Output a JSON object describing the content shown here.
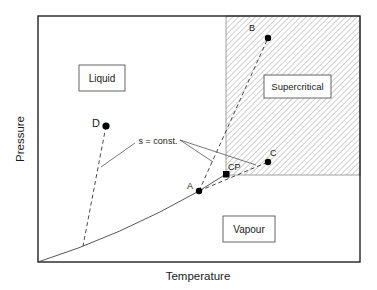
{
  "diagram": {
    "type": "phase-diagram",
    "axes": {
      "xlabel": "Temperature",
      "ylabel": "Pressure"
    },
    "regions": [
      {
        "id": "liquid",
        "label": "Liquid"
      },
      {
        "id": "supercritical",
        "label": "Supercritical"
      },
      {
        "id": "vapour",
        "label": "Vapour"
      }
    ],
    "points": {
      "A": "A",
      "B": "B",
      "C": "C",
      "D": "D",
      "CP": "CP"
    },
    "annotations": {
      "isentrope": "s = const."
    },
    "colors": {
      "line": "#333333",
      "frame": "#222222",
      "hatch": "#8a8a8a",
      "point": "#000000"
    }
  }
}
